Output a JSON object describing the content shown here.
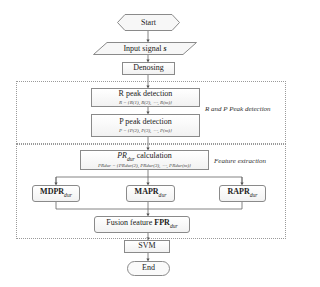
{
  "diagram": {
    "type": "flowchart",
    "nodes": {
      "start": {
        "label": "Start",
        "shape": "hexagon"
      },
      "input": {
        "label": "Input signal ",
        "var": "s",
        "shape": "parallelogram"
      },
      "denoise": {
        "label": "Denosing",
        "shape": "rectangle"
      },
      "r_peak": {
        "label": "R peak detection",
        "formula": "R = {R(1), R(2), ⋯, R(m)}",
        "shape": "rectangle"
      },
      "p_peak": {
        "label": "P peak detection",
        "formula": "P = {P(2), P(3), ⋯, P(m)}",
        "shape": "rectangle"
      },
      "pr_calc": {
        "label_main": "PR",
        "label_sub": "dur",
        "label_rest": " calculation",
        "formula": "PRdur = {PRdur(2), PRdur(3), ⋯, PRdur(m)}",
        "shape": "rectangle"
      },
      "mdpr": {
        "main": "MDPR",
        "sub": "dur",
        "shape": "rounded-rectangle"
      },
      "mapr": {
        "main": "MAPR",
        "sub": "dur",
        "shape": "rounded-rectangle"
      },
      "rapr": {
        "main": "RAPR",
        "sub": "dur",
        "shape": "rounded-rectangle"
      },
      "fusion": {
        "prefix": "Fusion feature ",
        "main": "FPR",
        "sub": "dur",
        "shape": "rounded-rectangle"
      },
      "svm": {
        "label": "SVM",
        "shape": "rectangle"
      },
      "end": {
        "label": "End",
        "shape": "terminator"
      }
    },
    "groups": {
      "rp_detection": {
        "label": "R and P Peak detection"
      },
      "feature_extraction": {
        "label": "Feature extraction"
      }
    },
    "edges": [
      [
        "start",
        "input"
      ],
      [
        "input",
        "denoise"
      ],
      [
        "denoise",
        "r_peak"
      ],
      [
        "r_peak",
        "p_peak"
      ],
      [
        "p_peak",
        "pr_calc"
      ],
      [
        "pr_calc",
        "mdpr"
      ],
      [
        "pr_calc",
        "mapr"
      ],
      [
        "pr_calc",
        "rapr"
      ],
      [
        "mdpr",
        "fusion"
      ],
      [
        "mapr",
        "fusion"
      ],
      [
        "rapr",
        "fusion"
      ],
      [
        "fusion",
        "svm"
      ],
      [
        "svm",
        "end"
      ]
    ],
    "colors": {
      "border": "#8a8a8a",
      "group_border": "#9a9a9a",
      "text": "#222222",
      "fill": "#f2f2f2"
    }
  }
}
